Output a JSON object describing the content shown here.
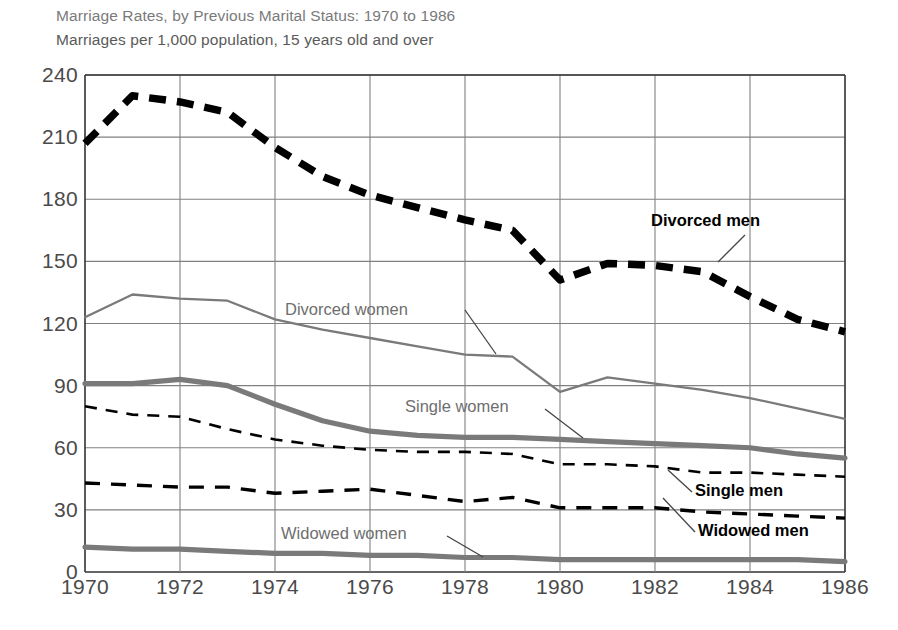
{
  "chart_data": {
    "type": "line",
    "title": "Marriage Rates, by Previous Marital Status: 1970 to 1986",
    "subtitle": "Marriages per 1,000 population, 15 years old and over",
    "xlabel": "",
    "ylabel": "",
    "xlim": [
      1970,
      1986
    ],
    "ylim": [
      0,
      240
    ],
    "grid": true,
    "legend_position": "inline-annotations",
    "x": [
      1970,
      1971,
      1972,
      1973,
      1974,
      1975,
      1976,
      1977,
      1978,
      1979,
      1980,
      1981,
      1982,
      1983,
      1984,
      1985,
      1986
    ],
    "xticks": [
      "1970",
      "1972",
      "1974",
      "1976",
      "1978",
      "1980",
      "1982",
      "1984",
      "1986"
    ],
    "yticks": [
      "0",
      "30",
      "60",
      "90",
      "120",
      "150",
      "180",
      "210",
      "240"
    ],
    "series": [
      {
        "name": "Divorced men",
        "color": "#000000",
        "style": "thick-dashed",
        "label_color": "black",
        "values": [
          207,
          230,
          227,
          222,
          205,
          191,
          182,
          176,
          170,
          165,
          141,
          149,
          148,
          145,
          133,
          122,
          116
        ]
      },
      {
        "name": "Divorced women",
        "color": "#7a7a7a",
        "style": "thin-solid",
        "label_color": "gray",
        "values": [
          123,
          134,
          132,
          131,
          122,
          117,
          113,
          109,
          105,
          104,
          87,
          94,
          91,
          88,
          84,
          79,
          74
        ]
      },
      {
        "name": "Single women",
        "color": "#7a7a7a",
        "style": "thick-solid",
        "label_color": "gray",
        "values": [
          91,
          91,
          93,
          90,
          81,
          73,
          68,
          66,
          65,
          65,
          64,
          63,
          62,
          61,
          60,
          57,
          55
        ]
      },
      {
        "name": "Single men",
        "color": "#000000",
        "style": "thin-dashed",
        "label_color": "black",
        "values": [
          80,
          76,
          75,
          69,
          64,
          61,
          59,
          58,
          58,
          57,
          52,
          52,
          51,
          48,
          48,
          47,
          46
        ]
      },
      {
        "name": "Widowed men",
        "color": "#000000",
        "style": "medium-dashed",
        "label_color": "black",
        "values": [
          43,
          42,
          41,
          41,
          38,
          39,
          40,
          37,
          34,
          36,
          31,
          31,
          31,
          29,
          28,
          27,
          26
        ]
      },
      {
        "name": "Widowed women",
        "color": "#7a7a7a",
        "style": "thick-solid",
        "label_color": "gray",
        "values": [
          12,
          11,
          11,
          10,
          9,
          9,
          8,
          8,
          7,
          7,
          6,
          6,
          6,
          6,
          6,
          6,
          5
        ]
      }
    ],
    "annotations": [
      {
        "text": "Divorced men",
        "tone": "black",
        "x_px": 651,
        "y_px": 211
      },
      {
        "text": "Divorced women",
        "tone": "gray",
        "x_px": 285,
        "y_px": 300
      },
      {
        "text": "Single women",
        "tone": "gray",
        "x_px": 405,
        "y_px": 397
      },
      {
        "text": "Single men",
        "tone": "black",
        "x_px": 695,
        "y_px": 481
      },
      {
        "text": "Widowed men",
        "tone": "black",
        "x_px": 698,
        "y_px": 521
      },
      {
        "text": "Widowed women",
        "tone": "gray",
        "x_px": 281,
        "y_px": 524
      }
    ]
  }
}
